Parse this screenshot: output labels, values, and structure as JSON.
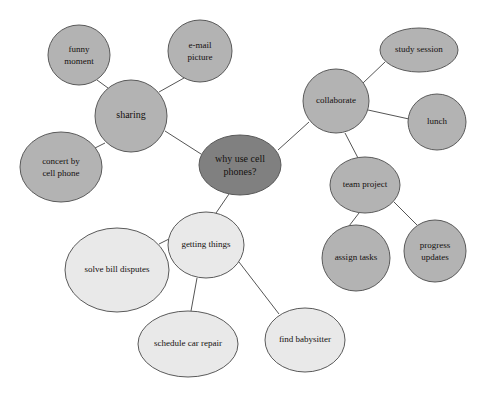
{
  "diagram": {
    "type": "mind-map",
    "background_color": "#ffffff",
    "edge_color": "#555555",
    "node_border_color": "#5a5a5a",
    "palette": {
      "center_dark": "#808080",
      "branch_medium": "#b3b3b3",
      "branch_light": "#e9e9e9"
    },
    "cropped_top_text": "",
    "nodes": [
      {
        "id": "center",
        "label_line1": "why use cell",
        "label_line2": "phones?",
        "shade": "center_dark",
        "cx": 240,
        "cy": 165,
        "rx": 41,
        "ry": 30,
        "font_size": 10
      },
      {
        "id": "sharing",
        "label_line1": "sharing",
        "label_line2": "",
        "shade": "branch_medium",
        "cx": 131,
        "cy": 116,
        "rx": 36,
        "ry": 36,
        "font_size": 10
      },
      {
        "id": "funny-moment",
        "label_line1": "funny",
        "label_line2": "moment",
        "shade": "branch_medium",
        "cx": 79,
        "cy": 55,
        "rx": 31,
        "ry": 30,
        "font_size": 9
      },
      {
        "id": "email-picture",
        "label_line1": "e-mail",
        "label_line2": "picture",
        "shade": "branch_medium",
        "cx": 200,
        "cy": 51,
        "rx": 32,
        "ry": 31,
        "font_size": 9
      },
      {
        "id": "concert-by-cell-phone",
        "label_line1": "concert by",
        "label_line2": "cell phone",
        "shade": "branch_medium",
        "cx": 61,
        "cy": 167,
        "rx": 41,
        "ry": 35,
        "font_size": 9
      },
      {
        "id": "collaborate",
        "label_line1": "collaborate",
        "label_line2": "",
        "shade": "branch_medium",
        "cx": 336,
        "cy": 101,
        "rx": 33,
        "ry": 32,
        "font_size": 9
      },
      {
        "id": "study-session",
        "label_line1": "study session",
        "label_line2": "",
        "shade": "branch_medium",
        "cx": 419,
        "cy": 50,
        "rx": 39,
        "ry": 22,
        "font_size": 9
      },
      {
        "id": "lunch",
        "label_line1": "lunch",
        "label_line2": "",
        "shade": "branch_medium",
        "cx": 437,
        "cy": 122,
        "rx": 29,
        "ry": 28,
        "font_size": 9
      },
      {
        "id": "team-project",
        "label_line1": "team project",
        "label_line2": "",
        "shade": "branch_medium",
        "cx": 365,
        "cy": 185,
        "rx": 35,
        "ry": 28,
        "font_size": 9
      },
      {
        "id": "assign-tasks",
        "label_line1": "assign tasks",
        "label_line2": "",
        "shade": "branch_medium",
        "cx": 356,
        "cy": 258,
        "rx": 34,
        "ry": 33,
        "font_size": 9
      },
      {
        "id": "progress-updates",
        "label_line1": "progress",
        "label_line2": "updates",
        "shade": "branch_medium",
        "cx": 435,
        "cy": 251,
        "rx": 31,
        "ry": 31,
        "font_size": 9
      },
      {
        "id": "getting-things",
        "label_line1": "getting things",
        "label_line2": "",
        "shade": "branch_light",
        "cx": 206,
        "cy": 245,
        "rx": 38,
        "ry": 33,
        "font_size": 9
      },
      {
        "id": "solve-bill-disputes",
        "label_line1": "solve bill disputes",
        "label_line2": "",
        "shade": "branch_light",
        "cx": 117,
        "cy": 270,
        "rx": 52,
        "ry": 42,
        "font_size": 9
      },
      {
        "id": "schedule-car-repair",
        "label_line1": "schedule car repair",
        "label_line2": "",
        "shade": "branch_light",
        "cx": 188,
        "cy": 344,
        "rx": 50,
        "ry": 33,
        "font_size": 9
      },
      {
        "id": "find-babysitter",
        "label_line1": "find babysitter",
        "label_line2": "",
        "shade": "branch_light",
        "cx": 305,
        "cy": 340,
        "rx": 40,
        "ry": 32,
        "font_size": 9
      }
    ],
    "edges": [
      {
        "id": "center-sharing",
        "from": "center",
        "to": "sharing",
        "x1": 201,
        "y1": 154,
        "x2": 165,
        "y2": 131
      },
      {
        "id": "center-collaborate",
        "from": "center",
        "to": "collaborate",
        "x1": 278,
        "y1": 150,
        "x2": 309,
        "y2": 122
      },
      {
        "id": "center-getting-things",
        "from": "center",
        "to": "getting-things",
        "x1": 229,
        "y1": 194,
        "x2": 216,
        "y2": 213
      },
      {
        "id": "sharing-funny-moment",
        "from": "sharing",
        "to": "funny-moment",
        "x1": 108,
        "y1": 88,
        "x2": 97,
        "y2": 80
      },
      {
        "id": "sharing-email-picture",
        "from": "sharing",
        "to": "email-picture",
        "x1": 159,
        "y1": 92,
        "x2": 184,
        "y2": 78
      },
      {
        "id": "sharing-concert",
        "from": "sharing",
        "to": "concert-by-cell-phone",
        "x1": 105,
        "y1": 143,
        "x2": 91,
        "y2": 150
      },
      {
        "id": "collaborate-study-session",
        "from": "collaborate",
        "to": "study-session",
        "x1": 363,
        "y1": 83,
        "x2": 385,
        "y2": 62
      },
      {
        "id": "collaborate-lunch",
        "from": "collaborate",
        "to": "lunch",
        "x1": 368,
        "y1": 110,
        "x2": 409,
        "y2": 119
      },
      {
        "id": "collaborate-team-project",
        "from": "collaborate",
        "to": "team-project",
        "x1": 345,
        "y1": 133,
        "x2": 358,
        "y2": 158
      },
      {
        "id": "team-project-assign-tasks",
        "from": "team-project",
        "to": "assign-tasks",
        "x1": 359,
        "y1": 213,
        "x2": 349,
        "y2": 226
      },
      {
        "id": "team-project-progress-updates",
        "from": "team-project",
        "to": "progress-updates",
        "x1": 394,
        "y1": 202,
        "x2": 417,
        "y2": 225
      },
      {
        "id": "getting-things-solve-bill",
        "from": "getting-things",
        "to": "solve-bill-disputes",
        "x1": 169,
        "y1": 239,
        "x2": 159,
        "y2": 244
      },
      {
        "id": "getting-things-schedule-car",
        "from": "getting-things",
        "to": "schedule-car-repair",
        "x1": 197,
        "y1": 278,
        "x2": 191,
        "y2": 311
      },
      {
        "id": "getting-things-find-babysitter",
        "from": "getting-things",
        "to": "find-babysitter",
        "x1": 239,
        "y1": 262,
        "x2": 279,
        "y2": 314
      }
    ]
  }
}
